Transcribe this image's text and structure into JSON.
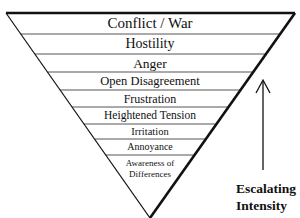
{
  "diagram": {
    "type": "inverted-pyramid",
    "levels": [
      {
        "label": "Conflict / War"
      },
      {
        "label": "Hostility"
      },
      {
        "label": "Anger"
      },
      {
        "label": "Open Disagreement"
      },
      {
        "label": "Frustration"
      },
      {
        "label": "Heightened Tension"
      },
      {
        "label": "Irritation"
      },
      {
        "label": "Annoyance"
      },
      {
        "label": "Awareness of",
        "label2": "Differences"
      }
    ],
    "arrow": {
      "direction": "up",
      "label_line1": "Escalating",
      "label_line2": "Intensity"
    },
    "colors": {
      "stroke": "#111111",
      "divider": "#555555",
      "background": "#ffffff"
    }
  }
}
